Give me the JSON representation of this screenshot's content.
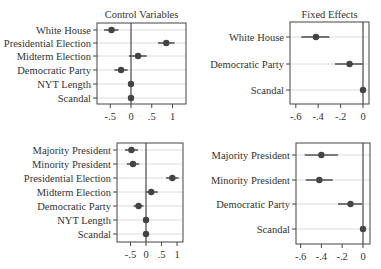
{
  "chart_data": [
    {
      "type": "scatter",
      "subtype": "coefficient-plot",
      "title": "Control Variables",
      "position": "top-left",
      "categories": [
        "White House",
        "Presidential Election",
        "Midterm Election",
        "Democratic Party",
        "NYT Length",
        "Scandal"
      ],
      "values": [
        -0.47,
        0.85,
        0.17,
        -0.24,
        0.0,
        0.0
      ],
      "ci_low": [
        -0.65,
        0.65,
        -0.05,
        -0.4,
        -0.02,
        -0.02
      ],
      "ci_high": [
        -0.3,
        1.05,
        0.38,
        -0.08,
        0.02,
        0.02
      ],
      "xticks": [
        "-.5",
        "0",
        ".5",
        "1"
      ],
      "xtick_values": [
        -0.5,
        0,
        0.5,
        1
      ],
      "xlim": [
        -0.82,
        1.3
      ],
      "reference_line": 0,
      "grid": true
    },
    {
      "type": "scatter",
      "subtype": "coefficient-plot",
      "title": "Fixed Effects",
      "position": "top-right",
      "categories": [
        "White House",
        "Democratic Party",
        "Scandal"
      ],
      "values": [
        -0.42,
        -0.12,
        0.0
      ],
      "ci_low": [
        -0.55,
        -0.25,
        -0.01
      ],
      "ci_high": [
        -0.3,
        0.0,
        0.01
      ],
      "xticks": [
        "-.6",
        "-.4",
        "-.2",
        "0"
      ],
      "xtick_values": [
        -0.6,
        -0.4,
        -0.2,
        0
      ],
      "xlim": [
        -0.66,
        0.04
      ],
      "reference_line": 0,
      "grid": true
    },
    {
      "type": "scatter",
      "subtype": "coefficient-plot",
      "title": "",
      "position": "bottom-left",
      "categories": [
        "Majority President",
        "Minority President",
        "Presidential Election",
        "Midterm Election",
        "Democratic Party",
        "NYT Length",
        "Scandal"
      ],
      "values": [
        -0.47,
        -0.42,
        0.85,
        0.17,
        -0.24,
        0.0,
        0.0
      ],
      "ci_low": [
        -0.68,
        -0.62,
        0.65,
        -0.02,
        -0.4,
        -0.02,
        -0.02
      ],
      "ci_high": [
        -0.26,
        -0.22,
        1.05,
        0.38,
        -0.08,
        0.02,
        0.02
      ],
      "xticks": [
        "-.5",
        "0",
        ".5",
        "1"
      ],
      "xtick_values": [
        -0.5,
        0,
        0.5,
        1
      ],
      "xlim": [
        -0.95,
        1.2
      ],
      "reference_line": 0,
      "grid": true
    },
    {
      "type": "scatter",
      "subtype": "coefficient-plot",
      "title": "",
      "position": "bottom-right",
      "categories": [
        "Majority President",
        "Minority President",
        "Democratic Party",
        "Scandal"
      ],
      "values": [
        -0.4,
        -0.42,
        -0.12,
        0.0
      ],
      "ci_low": [
        -0.56,
        -0.55,
        -0.24,
        -0.01
      ],
      "ci_high": [
        -0.24,
        -0.29,
        -0.01,
        0.01
      ],
      "xticks": [
        "-.6",
        "-.4",
        "-.2",
        "0"
      ],
      "xtick_values": [
        -0.6,
        -0.4,
        -0.2,
        0
      ],
      "xlim": [
        -0.66,
        0.06
      ],
      "reference_line": 0,
      "grid": true
    }
  ],
  "colors": {
    "point": "#444444",
    "ci": "#555555",
    "grid": "#dcdcdc",
    "frame": "#444444",
    "zero_line": "#555555"
  }
}
